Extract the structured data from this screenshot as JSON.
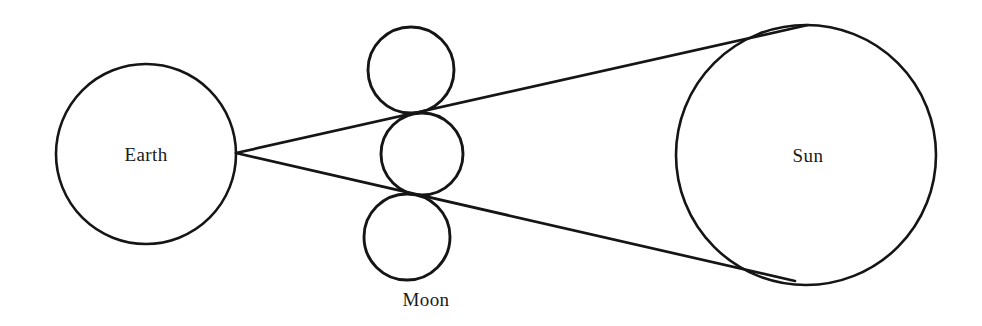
{
  "diagram": {
    "type": "astronomical-diagram",
    "background_color": "#ffffff",
    "stroke_color": "#151515",
    "labels": {
      "earth": "Earth",
      "moon": "Moon",
      "sun": "Sun"
    },
    "bodies": [
      {
        "name": "earth",
        "label": "Earth",
        "cx": 146,
        "cy": 154,
        "r": 90,
        "label_x": 146,
        "label_y": 155
      },
      {
        "name": "sun",
        "label": "Sun",
        "cx": 806,
        "cy": 155,
        "r": 130,
        "label_x": 808,
        "label_y": 156
      }
    ],
    "moon_positions": [
      {
        "name": "moon-upper",
        "cx": 411,
        "cy": 70,
        "r": 43
      },
      {
        "name": "moon-middle",
        "cx": 422,
        "cy": 154,
        "r": 41
      },
      {
        "name": "moon-lower",
        "cx": 407,
        "cy": 237,
        "r": 43
      }
    ],
    "moon_label_position": {
      "x": 426,
      "y": 300
    },
    "rays": [
      {
        "name": "upper-tangent-ray",
        "from_x": 236,
        "from_y": 153,
        "to_x": 808,
        "to_y": 25,
        "description": "line from Earth limb through upper Moon tangency to Sun upper limb"
      },
      {
        "name": "lower-tangent-ray",
        "from_x": 236,
        "from_y": 153,
        "to_x": 795,
        "to_y": 281,
        "description": "line from Earth limb through lower Moon tangency to Sun lower limb"
      }
    ]
  }
}
